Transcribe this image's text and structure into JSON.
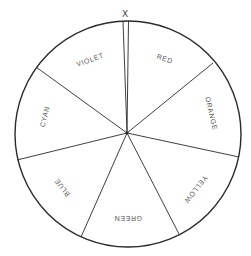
{
  "diagram": {
    "type": "color-wheel",
    "marker_label": "X",
    "colors": {
      "stroke": "#2a2a2a",
      "label": "#555555",
      "background": "#ffffff"
    },
    "segments": [
      {
        "label": "RED"
      },
      {
        "label": "ORANGE"
      },
      {
        "label": "YELLOW"
      },
      {
        "label": "GREEN"
      },
      {
        "label": "BLUE"
      },
      {
        "label": "CYAN"
      },
      {
        "label": "VIOLET"
      }
    ]
  }
}
